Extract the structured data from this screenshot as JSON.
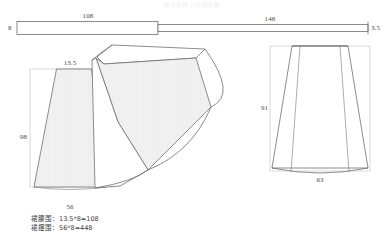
{
  "document": {
    "title_faint": "裙子纸样   八片喇叭裙"
  },
  "waistband": {
    "name": "waistband-strip",
    "left_height_label": "8",
    "top_length_label": "108",
    "right_length_label": "148",
    "right_height_label": "3.5"
  },
  "gore_panel": {
    "name": "single-gore-panel",
    "top_width_label": "13.5",
    "height_label": "98",
    "hem_width_label": "56"
  },
  "fan": {
    "name": "gore-fan-layout",
    "panel_count": 4
  },
  "silhouette": {
    "name": "skirt-silhouette",
    "height_label": "91",
    "hem_label": "63"
  },
  "notes": {
    "line1": "裙腰围：13.5*8=108",
    "line2": "裙摆围：56*8=448"
  },
  "colors": {
    "line": "#6e6e6e",
    "fill_shaded": "#efefef",
    "fill_plain": "#ffffff",
    "text": "#3c3c3c",
    "background": "#ffffff"
  }
}
